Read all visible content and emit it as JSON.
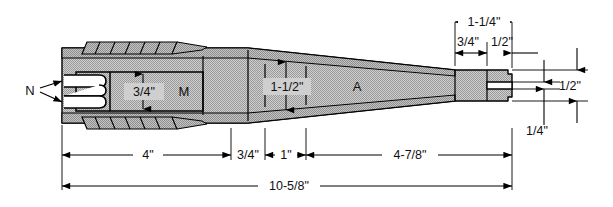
{
  "drawing": {
    "type": "mechanical-cross-section",
    "background_color": "#ffffff",
    "line_color": "#000000",
    "body_fill": "#c9c9c9",
    "hatch_fill": "#bdbdbd",
    "cavity_fill": "#ffffff"
  },
  "part_labels": {
    "n": "N",
    "m": "M",
    "a": "A"
  },
  "internal_dims": {
    "height_m": "3/4\"",
    "height_mid": "1-1/2\""
  },
  "top_dims": {
    "overall_tip": "1-1/4\"",
    "left_seg": "3/4\"",
    "right_seg": "1/2\""
  },
  "right_dims": {
    "upper": "1/2\"",
    "lower": "1/4\""
  },
  "bottom_dims": {
    "seg1": "4\"",
    "seg2": "3/4\"",
    "seg3": "1\"",
    "seg4": "4-7/8\"",
    "overall": "10-5/8\""
  }
}
